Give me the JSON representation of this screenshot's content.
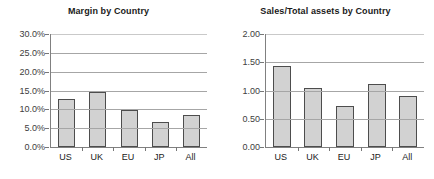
{
  "chart_data": [
    {
      "type": "bar",
      "title": "Margin by Country",
      "categories": [
        "US",
        "UK",
        "EU",
        "JP",
        "All"
      ],
      "values": [
        12.7,
        14.5,
        9.8,
        6.7,
        8.6
      ],
      "tick_labels": [
        "0.0%",
        "5.0%",
        "10.0%",
        "15.0%",
        "20.0%",
        "25.0%",
        "30.0%"
      ],
      "tick_values": [
        0,
        5,
        10,
        15,
        20,
        25,
        30
      ],
      "ylim": [
        0,
        30
      ],
      "xlabel": "",
      "ylabel": "",
      "grid": true,
      "legend": "none",
      "bar_fill": "#d2d2d2",
      "bar_border": "#4d4d4d"
    },
    {
      "type": "bar",
      "title": "Sales/Total assets by Country",
      "categories": [
        "US",
        "UK",
        "EU",
        "JP",
        "All"
      ],
      "values": [
        1.43,
        1.04,
        0.72,
        1.12,
        0.9
      ],
      "tick_labels": [
        "0.00",
        "0.50",
        "1.00",
        "1.50",
        "2.00"
      ],
      "tick_values": [
        0,
        0.5,
        1,
        1.5,
        2
      ],
      "ylim": [
        0,
        2
      ],
      "xlabel": "",
      "ylabel": "",
      "grid": true,
      "legend": "none",
      "bar_fill": "#d2d2d2",
      "bar_border": "#4d4d4d"
    }
  ]
}
